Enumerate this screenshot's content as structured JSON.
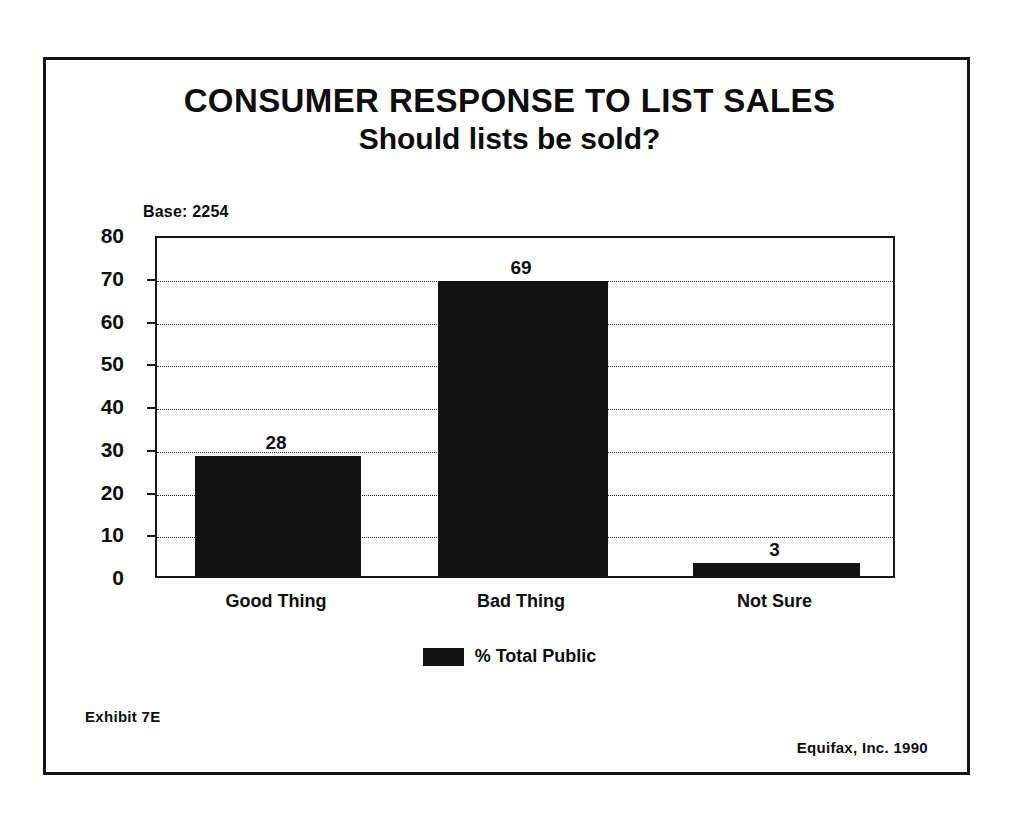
{
  "chart_data": {
    "type": "bar",
    "title": "CONSUMER RESPONSE TO LIST SALES",
    "subtitle": "Should lists be sold?",
    "categories": [
      "Good Thing",
      "Bad Thing",
      "Not Sure"
    ],
    "values": [
      28,
      69,
      3
    ],
    "series": [
      {
        "name": "% Total Public",
        "values": [
          28,
          69,
          3
        ]
      }
    ],
    "value_labels": [
      "28",
      "69",
      "3"
    ],
    "xlabel": "",
    "ylabel": "",
    "ylim": [
      0,
      80
    ],
    "yticks": [
      80,
      70,
      60,
      50,
      40,
      30,
      20,
      10,
      0
    ],
    "ytick_labels": [
      "80",
      "70",
      "60",
      "50",
      "40",
      "30",
      "20",
      "10",
      "0"
    ],
    "grid": true,
    "legend_position": "bottom",
    "bar_color": "#111111",
    "base_note": "Base: 2254"
  },
  "legend": {
    "entries": [
      {
        "label": "% Total Public",
        "color": "#111111",
        "swatch": "legend-swatch-total-public"
      }
    ]
  },
  "footer": {
    "exhibit": "Exhibit 7E",
    "source": "Equifax, Inc. 1990"
  },
  "colors": {
    "ink": "#0d0d0d",
    "bar": "#111111",
    "frame": "#151515",
    "grid": "#2a2a2a",
    "paper": "#ffffff"
  }
}
